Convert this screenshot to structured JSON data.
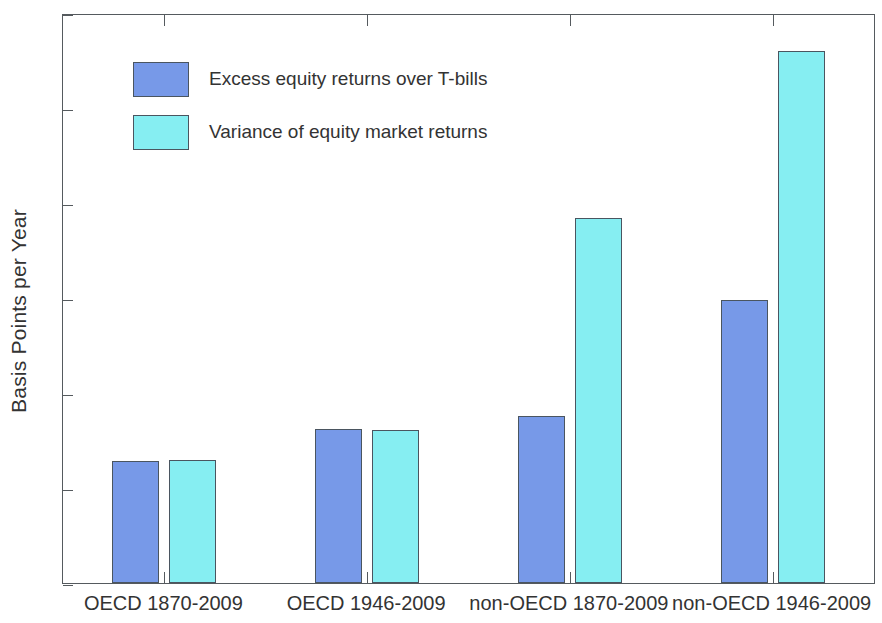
{
  "chart_data": {
    "type": "bar",
    "title": "",
    "xlabel": "",
    "ylabel": "Basis Points per Year",
    "ylim": [
      0,
      3000
    ],
    "yticks": [
      0,
      500,
      1000,
      1500,
      2000,
      2500,
      3000
    ],
    "ytick_labels": [
      "0",
      "500",
      "1000",
      "1500",
      "2000",
      "2500",
      "3000"
    ],
    "grid": false,
    "legend_position": "upper left",
    "categories": [
      "OECD 1870-2009",
      "OECD 1946-2009",
      "non-OECD 1870-2009",
      "non-OECD 1946-2009"
    ],
    "series": [
      {
        "name": "Excess equity returns over T-bills",
        "color": "#7799e8",
        "values": [
          640,
          810,
          880,
          1490
        ]
      },
      {
        "name": "Variance of equity market returns",
        "color": "#86eef2",
        "values": [
          645,
          805,
          1920,
          2800
        ]
      }
    ]
  },
  "axis": {
    "y_title": "Basis Points per Year",
    "tick_labels": [
      "3000",
      "2500",
      "2000",
      "1500",
      "1000",
      "500",
      "0"
    ]
  },
  "legend": {
    "entries": [
      {
        "label": "Excess equity returns over T-bills"
      },
      {
        "label": "Variance of equity market returns"
      }
    ]
  },
  "colors": {
    "series0": "#7799e8",
    "series1": "#86eef2",
    "axis": "#555a5e",
    "bar_border": "#4a5560",
    "text": "#333333",
    "background": "#ffffff"
  }
}
